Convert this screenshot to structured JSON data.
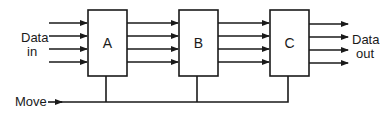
{
  "diagram": {
    "type": "pipeline-block-diagram",
    "input_label": [
      "Data",
      "in"
    ],
    "output_label": [
      "Data",
      "out"
    ],
    "control_label": "Move",
    "stages": [
      {
        "id": "A",
        "label": "A"
      },
      {
        "id": "B",
        "label": "B"
      },
      {
        "id": "C",
        "label": "C"
      }
    ],
    "lines_per_bus": 4,
    "colors": {
      "stroke": "#1a1a1a",
      "background": "#ffffff"
    }
  }
}
